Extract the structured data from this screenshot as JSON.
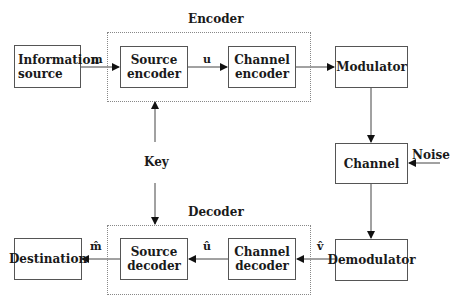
{
  "groups": {
    "encoder": {
      "label": "Encoder"
    },
    "decoder": {
      "label": "Decoder"
    }
  },
  "blocks": {
    "information_source": "Information source",
    "source_encoder": "Source encoder",
    "channel_encoder": "Channel encoder",
    "modulator": "Modulator",
    "channel": "Channel",
    "demodulator": "Demodulator",
    "channel_decoder": "Channel decoder",
    "source_decoder": "Source decoder",
    "destination": "Destination"
  },
  "signals": {
    "m": "m",
    "u": "u",
    "v_hat": "v̂",
    "u_hat": "û",
    "m_hat": "m̂",
    "key": "Key",
    "noise": "Noise"
  }
}
